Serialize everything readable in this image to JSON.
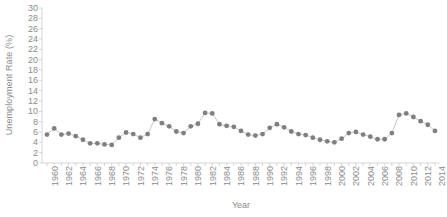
{
  "chart_data": {
    "type": "line",
    "title": "",
    "xlabel": "Year",
    "ylabel": "Unemployment Rate (%)",
    "xlim": [
      1959.3,
      2014.7
    ],
    "ylim": [
      0,
      30
    ],
    "ytick_step": 2,
    "yticks": [
      0,
      2,
      4,
      6,
      8,
      10,
      12,
      14,
      16,
      18,
      20,
      22,
      24,
      26,
      28,
      30
    ],
    "xtick_labels": [
      1960,
      1962,
      1964,
      1966,
      1968,
      1970,
      1972,
      1974,
      1976,
      1978,
      1980,
      1982,
      1984,
      1986,
      1988,
      1990,
      1992,
      1994,
      1996,
      1998,
      2000,
      2002,
      2004,
      2006,
      2008,
      2010,
      2012,
      2014
    ],
    "xtick_label_rotation": -90,
    "grid": false,
    "legend": false,
    "marker": "circle",
    "marker_color": "#7f7f7f",
    "line_color": "#bfbfbf",
    "background_color": "#ffffff",
    "axis_color": "#cccccc",
    "text_color": "#8c8c8c",
    "x": [
      1960,
      1961,
      1962,
      1963,
      1964,
      1965,
      1966,
      1967,
      1968,
      1969,
      1970,
      1971,
      1972,
      1973,
      1974,
      1975,
      1976,
      1977,
      1978,
      1979,
      1980,
      1981,
      1982,
      1983,
      1984,
      1985,
      1986,
      1987,
      1988,
      1989,
      1990,
      1991,
      1992,
      1993,
      1994,
      1995,
      1996,
      1997,
      1998,
      1999,
      2000,
      2001,
      2002,
      2003,
      2004,
      2005,
      2006,
      2007,
      2008,
      2009,
      2010,
      2011,
      2012,
      2013,
      2014
    ],
    "values": [
      5.5,
      6.7,
      5.5,
      5.7,
      5.2,
      4.5,
      3.8,
      3.8,
      3.6,
      3.5,
      4.9,
      5.9,
      5.6,
      4.9,
      5.6,
      8.5,
      7.7,
      7.1,
      6.1,
      5.8,
      7.1,
      7.6,
      9.7,
      9.6,
      7.5,
      7.2,
      7.0,
      6.2,
      5.5,
      5.3,
      5.6,
      6.8,
      7.5,
      6.9,
      6.1,
      5.6,
      5.4,
      4.9,
      4.5,
      4.2,
      4.0,
      4.7,
      5.8,
      6.0,
      5.5,
      5.1,
      4.6,
      4.6,
      5.8,
      9.3,
      9.6,
      8.9,
      8.1,
      7.4,
      6.2
    ],
    "series_name": "Unemployment Rate"
  }
}
